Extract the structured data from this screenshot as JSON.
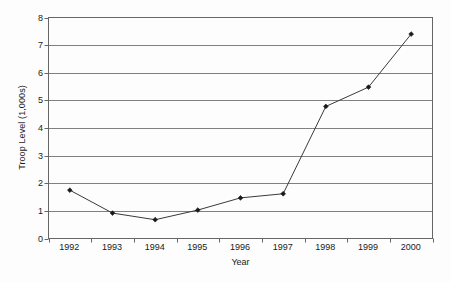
{
  "chart_data": {
    "type": "line",
    "title": "",
    "xlabel": "Year",
    "ylabel": "Troop Level (1,000s)",
    "categories": [
      "1992",
      "1993",
      "1994",
      "1995",
      "1996",
      "1997",
      "1998",
      "1999",
      "2000"
    ],
    "values": [
      1.75,
      0.92,
      0.68,
      1.03,
      1.47,
      1.62,
      4.78,
      5.48,
      7.4
    ],
    "series": [
      {
        "name": "Troop Level",
        "values": [
          1.75,
          0.92,
          0.68,
          1.03,
          1.47,
          1.62,
          4.78,
          5.48,
          7.4
        ]
      }
    ],
    "ylim": [
      0,
      8
    ],
    "yticks": [
      0,
      1,
      2,
      3,
      4,
      5,
      6,
      7,
      8
    ],
    "ytick_labels": [
      "0",
      "1",
      "2",
      "3",
      "4",
      "5",
      "6",
      "7",
      "8"
    ],
    "grid": "horizontal",
    "legend": "none",
    "marker": "diamond",
    "line_color": "#3a3a3a",
    "marker_color": "#1a1a1a",
    "grid_color": "#808080",
    "axis_color": "#666666",
    "plot_background": "#ffffff"
  }
}
